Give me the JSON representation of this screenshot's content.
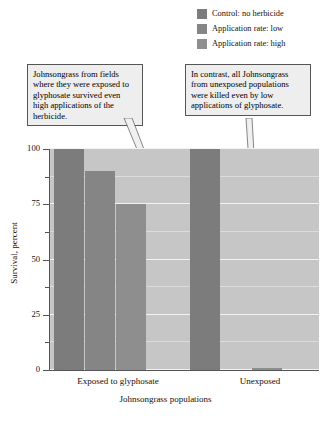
{
  "legend": {
    "items": [
      {
        "label": "Control: no herbicide",
        "color": "#7c7c7c",
        "swatch_name": "legend-swatch-control"
      },
      {
        "label": "Application rate: low",
        "color": "#858585",
        "swatch_name": "legend-swatch-low"
      },
      {
        "label": "Application rate: high",
        "color": "#8e8e8e",
        "swatch_name": "legend-swatch-high"
      }
    ]
  },
  "annotations": {
    "left": "Johnsongrass from fields where they were exposed to glyphosate survived even high applications of the herbicide.",
    "right": "In contrast, all Johnsongrass from unexposed populations were killed even by low applications of glyphosate."
  },
  "chart_data": {
    "type": "bar",
    "title": "",
    "xlabel": "Johnsongrass populations",
    "ylabel": "Survival, percent",
    "ylim": [
      0,
      100
    ],
    "yticks": [
      0,
      25,
      50,
      75,
      100
    ],
    "ytick_labels": [
      "0",
      "25",
      "50",
      "75",
      "100"
    ],
    "minor_ticks": [
      12.5,
      37.5,
      62.5,
      87.5
    ],
    "grid": true,
    "legend_position": "top-right",
    "categories": [
      "Exposed to glyphosate",
      "Unexposed"
    ],
    "series": [
      {
        "name": "Control: no herbicide",
        "values": [
          100,
          100
        ],
        "color": "#7c7c7c"
      },
      {
        "name": "Application rate: low",
        "values": [
          90,
          0
        ],
        "color": "#858585"
      },
      {
        "name": "Application rate: high",
        "values": [
          75,
          1
        ],
        "color": "#8e8e8e"
      }
    ]
  },
  "colors": {
    "plot_background": "#c6c6c6",
    "gridline": "#f2f2f2",
    "axis": "#555555",
    "callout_background": "#eeeeee",
    "callout_border": "#555555",
    "bar_dark": "#7c7c7c"
  }
}
